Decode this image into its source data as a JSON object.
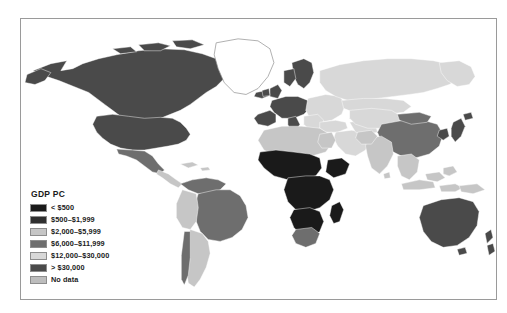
{
  "figure": {
    "type": "choropleth-world-map",
    "background_color": "#ffffff",
    "frame_color": "#9a9a9a"
  },
  "legend": {
    "title": "GDP PC",
    "items": [
      {
        "label": "< $500",
        "color": "#1a1a1a"
      },
      {
        "label": "$500–$1,999",
        "color": "#2f2f2f"
      },
      {
        "label": "$2,000–$5,999",
        "color": "#c6c6c6"
      },
      {
        "label": "$6,000–$11,999",
        "color": "#6e6e6e"
      },
      {
        "label": "$12,000–$30,000",
        "color": "#d8d8d8"
      },
      {
        "label": "> $30,000",
        "color": "#4a4a4a"
      },
      {
        "label": "No data",
        "color": "#bdbdbd"
      }
    ]
  },
  "chart_data": {
    "type": "heatmap",
    "title": "GDP PC",
    "xlabel": "",
    "ylabel": "",
    "projection": "equirectangular",
    "categories": [
      "< $500",
      "$500–$1,999",
      "$2,000–$5,999",
      "$6,000–$11,999",
      "$12,000–$30,000",
      "> $30,000",
      "No data"
    ],
    "category_colors": [
      "#1a1a1a",
      "#2f2f2f",
      "#c6c6c6",
      "#6e6e6e",
      "#d8d8d8",
      "#4a4a4a",
      "#bdbdbd"
    ],
    "regions": [
      {
        "name": "United States",
        "category": "> $30,000"
      },
      {
        "name": "Canada",
        "category": "> $30,000"
      },
      {
        "name": "Mexico",
        "category": "$6,000–$11,999"
      },
      {
        "name": "Central America",
        "category": "$2,000–$5,999"
      },
      {
        "name": "Brazil",
        "category": "$6,000–$11,999"
      },
      {
        "name": "Argentina",
        "category": "$2,000–$5,999"
      },
      {
        "name": "Chile",
        "category": "$6,000–$11,999"
      },
      {
        "name": "Western Europe",
        "category": "> $30,000"
      },
      {
        "name": "Eastern Europe",
        "category": "$12,000–$30,000"
      },
      {
        "name": "Russia",
        "category": "$12,000–$30,000"
      },
      {
        "name": "North Africa",
        "category": "$2,000–$5,999"
      },
      {
        "name": "Sub-Saharan Africa",
        "category": "< $500"
      },
      {
        "name": "South Africa",
        "category": "$6,000–$11,999"
      },
      {
        "name": "Middle East",
        "category": "$12,000–$30,000"
      },
      {
        "name": "India",
        "category": "$2,000–$5,999"
      },
      {
        "name": "China",
        "category": "$6,000–$11,999"
      },
      {
        "name": "Japan",
        "category": "> $30,000"
      },
      {
        "name": "Southeast Asia",
        "category": "$2,000–$5,999"
      },
      {
        "name": "Australia",
        "category": "> $30,000"
      },
      {
        "name": "New Zealand",
        "category": "> $30,000"
      },
      {
        "name": "Greenland",
        "category": "No data"
      }
    ]
  }
}
